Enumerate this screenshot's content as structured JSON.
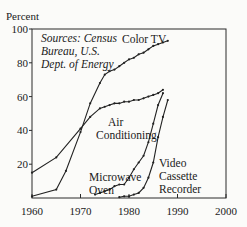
{
  "chart_data": {
    "type": "line",
    "title": "",
    "xlabel": "",
    "ylabel": "Percent",
    "xlim": [
      1960,
      2000
    ],
    "ylim": [
      0,
      100
    ],
    "x_ticks": [
      1960,
      1970,
      1980,
      1990,
      2000
    ],
    "y_ticks": [
      20,
      40,
      60,
      80,
      100
    ],
    "grid": false,
    "legend": "none (labels placed directly on lines)",
    "annotation": [
      "Sources: Census",
      "Bureau, U.S.",
      "Dept. of Energy"
    ],
    "series": [
      {
        "name": "Color TV",
        "label_lines": [
          "Color TV"
        ],
        "x": [
          1960,
          1965,
          1967,
          1970,
          1972,
          1974,
          1975,
          1976,
          1977,
          1978,
          1979,
          1980,
          1981,
          1982,
          1983,
          1984,
          1985,
          1986,
          1987,
          1988
        ],
        "y": [
          1,
          5,
          16,
          39,
          56,
          68,
          73,
          75,
          76,
          78,
          80,
          82,
          83,
          85,
          86,
          88,
          90,
          91,
          92,
          93
        ]
      },
      {
        "name": "Air Conditioning",
        "label_lines": [
          "Air",
          "Conditioning"
        ],
        "x": [
          1960,
          1965,
          1970,
          1972,
          1974,
          1975,
          1976,
          1977,
          1978,
          1979,
          1980,
          1981,
          1982,
          1983,
          1984,
          1985,
          1986,
          1987
        ],
        "y": [
          15,
          24,
          41,
          48,
          53,
          54,
          55,
          56,
          56,
          57,
          57,
          58,
          58,
          59,
          60,
          61,
          62,
          64
        ]
      },
      {
        "name": "Microwave Oven",
        "label_lines": [
          "Microwave",
          "Oven"
        ],
        "x": [
          1973,
          1974,
          1975,
          1976,
          1977,
          1978,
          1979,
          1980,
          1981,
          1982,
          1983,
          1984,
          1985,
          1986,
          1987
        ],
        "y": [
          2,
          3,
          4,
          5,
          7,
          8,
          8,
          12,
          17,
          21,
          25,
          33,
          44,
          55,
          62
        ]
      },
      {
        "name": "Video Cassette Recorder",
        "label_lines": [
          "Video",
          "Cassette",
          "Recorder"
        ],
        "x": [
          1978,
          1979,
          1980,
          1981,
          1982,
          1983,
          1984,
          1985,
          1986,
          1987,
          1988
        ],
        "y": [
          0.5,
          1,
          1,
          2,
          3,
          6,
          12,
          21,
          36,
          48,
          58
        ]
      }
    ]
  }
}
